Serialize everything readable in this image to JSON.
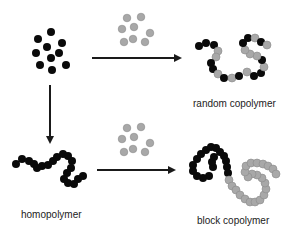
{
  "colors": {
    "monomer_a": "#0a0a0a",
    "monomer_b": "#a8a8a8",
    "monomer_b_stroke": "#8a8a8a",
    "arrow": "#1a1a1a",
    "background": "#ffffff"
  },
  "labels": {
    "random": "random copolymer",
    "homo": "homopolymer",
    "block": "block copolymer"
  },
  "monomer_a_cluster": [
    [
      51,
      32
    ],
    [
      38,
      39
    ],
    [
      62,
      43
    ],
    [
      47,
      47
    ],
    [
      36,
      53
    ],
    [
      59,
      53
    ],
    [
      51,
      58
    ],
    [
      40,
      65
    ],
    [
      66,
      65
    ],
    [
      52,
      70
    ]
  ],
  "monomer_b_cluster_top": [
    [
      127,
      18
    ],
    [
      141,
      17
    ],
    [
      122,
      29
    ],
    [
      134,
      27
    ],
    [
      150,
      33
    ],
    [
      124,
      42
    ],
    [
      133,
      39
    ],
    [
      145,
      42
    ]
  ],
  "monomer_b_cluster_bottom": [
    [
      127,
      128
    ],
    [
      141,
      127
    ],
    [
      122,
      139
    ],
    [
      134,
      137
    ],
    [
      150,
      143
    ],
    [
      124,
      152
    ],
    [
      133,
      149
    ],
    [
      145,
      152
    ]
  ],
  "arrows": {
    "top": {
      "x1": 92,
      "y1": 58,
      "x2": 180,
      "y2": 58
    },
    "bottom": {
      "x1": 97,
      "y1": 170,
      "x2": 174,
      "y2": 170
    },
    "down": {
      "x1": 50,
      "y1": 85,
      "x2": 50,
      "y2": 142
    }
  },
  "random_copolymer": [
    [
      199,
      46,
      "A"
    ],
    [
      206,
      43,
      "A"
    ],
    [
      214,
      45,
      "A"
    ],
    [
      218,
      51,
      "B"
    ],
    [
      216,
      57,
      "B"
    ],
    [
      211,
      63,
      "A"
    ],
    [
      213,
      69,
      "A"
    ],
    [
      218,
      74,
      "B"
    ],
    [
      224,
      78,
      "A"
    ],
    [
      232,
      78,
      "B"
    ],
    [
      239,
      76,
      "A"
    ],
    [
      247,
      72,
      "B"
    ],
    [
      254,
      76,
      "A"
    ],
    [
      261,
      73,
      "A"
    ],
    [
      264,
      67,
      "B"
    ],
    [
      262,
      60,
      "A"
    ],
    [
      257,
      56,
      "B"
    ],
    [
      250,
      54,
      "B"
    ],
    [
      245,
      50,
      "B"
    ],
    [
      243,
      43,
      "A"
    ],
    [
      248,
      38,
      "A"
    ],
    [
      255,
      38,
      "B"
    ],
    [
      261,
      42,
      "A"
    ],
    [
      267,
      45,
      "B"
    ]
  ],
  "homopolymer": [
    [
      16,
      164
    ],
    [
      22,
      159
    ],
    [
      29,
      161
    ],
    [
      34,
      164
    ],
    [
      37,
      168
    ],
    [
      42,
      166
    ],
    [
      48,
      165
    ],
    [
      53,
      161
    ],
    [
      57,
      157
    ],
    [
      63,
      154
    ],
    [
      68,
      156
    ],
    [
      72,
      161
    ],
    [
      71,
      168
    ],
    [
      67,
      173
    ],
    [
      64,
      179
    ],
    [
      68,
      183
    ],
    [
      74,
      184
    ],
    [
      78,
      179
    ],
    [
      83,
      176
    ]
  ],
  "block_copolymer": [
    [
      213,
      167,
      "A"
    ],
    [
      212,
      162,
      "A"
    ],
    [
      214,
      157,
      "A"
    ],
    [
      209,
      176,
      "A"
    ],
    [
      203,
      178,
      "A"
    ],
    [
      197,
      176,
      "A"
    ],
    [
      193,
      171,
      "A"
    ],
    [
      193,
      165,
      "A"
    ],
    [
      197,
      159,
      "A"
    ],
    [
      201,
      154,
      "A"
    ],
    [
      206,
      150,
      "A"
    ],
    [
      211,
      147,
      "A"
    ],
    [
      216,
      148,
      "A"
    ],
    [
      220,
      152,
      "A"
    ],
    [
      224,
      156,
      "A"
    ],
    [
      226,
      161,
      "A"
    ],
    [
      227,
      167,
      "A"
    ],
    [
      228,
      173,
      "A"
    ],
    [
      229,
      180,
      "B"
    ],
    [
      232,
      186,
      "B"
    ],
    [
      236,
      190,
      "B"
    ],
    [
      240,
      195,
      "B"
    ],
    [
      245,
      199,
      "B"
    ],
    [
      250,
      202,
      "B"
    ],
    [
      255,
      202,
      "B"
    ],
    [
      260,
      200,
      "B"
    ],
    [
      264,
      195,
      "B"
    ],
    [
      266,
      189,
      "B"
    ],
    [
      265,
      183,
      "B"
    ],
    [
      262,
      178,
      "B"
    ],
    [
      257,
      175,
      "B"
    ],
    [
      252,
      174,
      "B"
    ],
    [
      248,
      177,
      "B"
    ],
    [
      245,
      172,
      "B"
    ],
    [
      246,
      166,
      "B"
    ],
    [
      251,
      163,
      "B"
    ],
    [
      257,
      163,
      "B"
    ],
    [
      263,
      164,
      "B"
    ],
    [
      268,
      166,
      "B"
    ],
    [
      273,
      169,
      "B"
    ],
    [
      276,
      174,
      "B"
    ]
  ]
}
